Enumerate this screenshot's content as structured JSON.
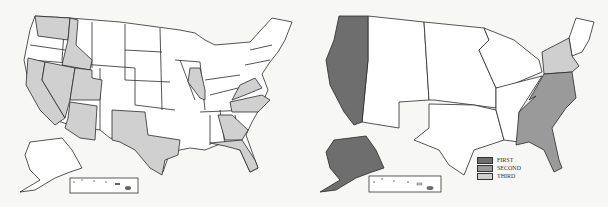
{
  "maps": [
    {
      "id": "left",
      "description": "US state map with selected states highlighted in light gray",
      "highlighted_states": [
        "Washington",
        "Idaho",
        "California",
        "Nevada",
        "Utah",
        "Arizona",
        "Texas",
        "Illinois",
        "Virginia",
        "North Carolina",
        "Georgia",
        "Florida"
      ],
      "fill_highlight": "#d0d0d0",
      "fill_default": "#ffffff"
    },
    {
      "id": "right",
      "description": "US regional map shaded by rank",
      "regions": [
        {
          "name": "Pacific",
          "rank": "FIRST",
          "color": "#6e6e6e"
        },
        {
          "name": "South Atlantic",
          "rank": "SECOND",
          "color": "#9a9a9a"
        },
        {
          "name": "Middle Atlantic",
          "rank": "THIRD",
          "color": "#cfcfcf"
        }
      ]
    }
  ],
  "legend": {
    "items": [
      {
        "label": "FIRST",
        "color": "#6e6e6e"
      },
      {
        "label": "SECOND",
        "color": "#9a9a9a"
      },
      {
        "label": "THIRD",
        "color": "#cfcfcf"
      }
    ]
  }
}
